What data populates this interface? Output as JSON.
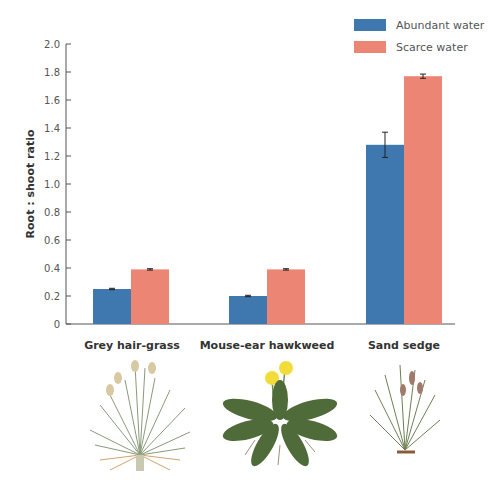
{
  "chart_data": {
    "type": "bar",
    "title": "",
    "xlabel": "",
    "ylabel": "Root : shoot ratio",
    "ylim": [
      0,
      2.0
    ],
    "yticks": [
      "0",
      "0.2",
      "0.4",
      "0.6",
      "0.8",
      "1.0",
      "1.2",
      "1.4",
      "1.6",
      "1.8",
      "2.0"
    ],
    "grid": false,
    "legend_position": "top-right",
    "categories": [
      "Grey hair-grass",
      "Mouse-ear hawkweed",
      "Sand sedge"
    ],
    "series": [
      {
        "name": "Abundant water",
        "color": "#3F78AE",
        "values": [
          0.25,
          0.2,
          1.28
        ],
        "errors": [
          0.005,
          0.005,
          0.09
        ]
      },
      {
        "name": "Scarce water",
        "color": "#EC8574",
        "values": [
          0.39,
          0.39,
          1.77
        ],
        "errors": [
          0.005,
          0.005,
          0.015
        ]
      }
    ]
  },
  "legend": {
    "items": [
      {
        "label": "Abundant water",
        "color": "#3F78AE"
      },
      {
        "label": "Scarce water",
        "color": "#EC8574"
      }
    ]
  },
  "categories": {
    "labels": [
      "Grey hair-grass",
      "Mouse-ear hawkweed",
      "Sand sedge"
    ]
  },
  "axis": {
    "ylabel": "Root : shoot ratio"
  }
}
